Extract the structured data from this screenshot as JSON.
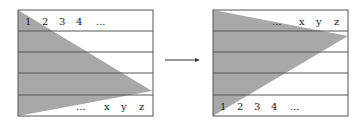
{
  "left_panel": {
    "top_row_labels": [
      "1",
      "2",
      "3",
      "4",
      "..."
    ],
    "bottom_row_labels": [
      "...",
      "x",
      "y",
      "z"
    ]
  },
  "right_panel": {
    "top_row_labels": [
      "...",
      "x",
      "y",
      "z"
    ],
    "bottom_row_labels": [
      "1",
      "2",
      "3",
      "4",
      "..."
    ]
  },
  "colors": {
    "fill": "#a8a8a8",
    "line": "#555555",
    "background": "#ffffff"
  }
}
